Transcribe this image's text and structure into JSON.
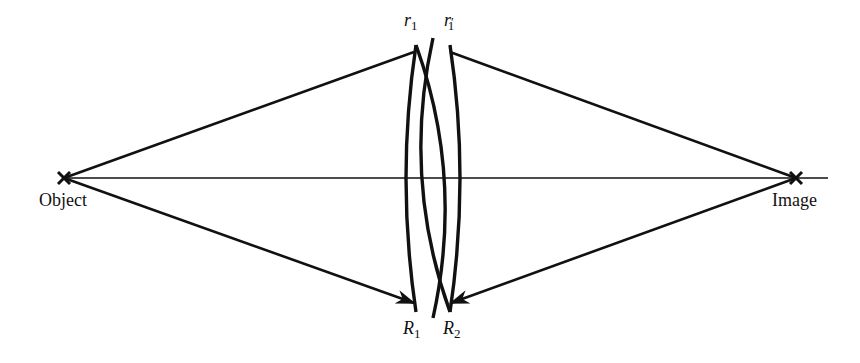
{
  "diagram": {
    "type": "optics-ray-diagram",
    "labels": {
      "object": "Object",
      "image": "Image",
      "r1": "r",
      "r1_sub": "1",
      "r1prime": "r",
      "r1prime_sub": "1",
      "r1prime_mark": "′",
      "R1": "R",
      "R1_sub": "1",
      "R2": "R",
      "R2_sub": "2"
    },
    "colors": {
      "stroke": "#111111",
      "background": "#ffffff"
    },
    "points": {
      "object": [
        64,
        178
      ],
      "image": [
        796,
        178
      ]
    }
  }
}
